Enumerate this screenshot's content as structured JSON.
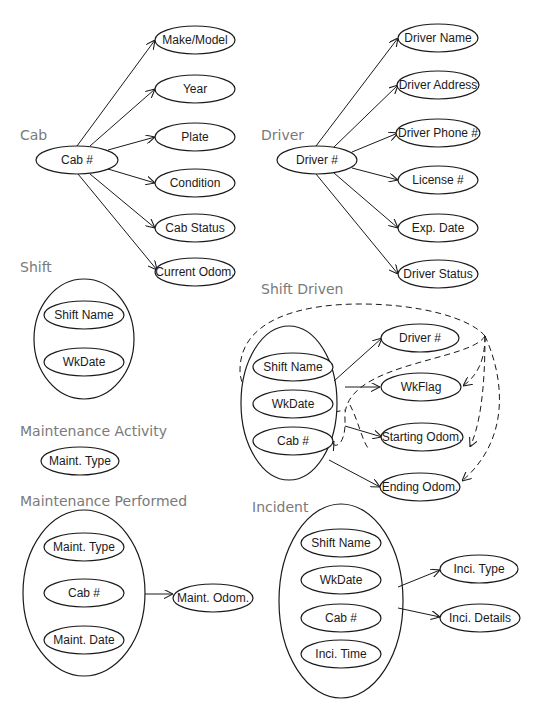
{
  "sections": {
    "cab": {
      "title": "Cab",
      "key": "Cab #",
      "attributes": [
        "Make/Model",
        "Year",
        "Plate",
        "Condition",
        "Cab Status",
        "Current Odom."
      ]
    },
    "driver": {
      "title": "Driver",
      "key": "Driver #",
      "attributes": [
        "Driver Name",
        "Driver Address",
        "Driver Phone #",
        "License #",
        "Exp. Date",
        "Driver Status"
      ]
    },
    "shift": {
      "title": "Shift",
      "composite_key": [
        "Shift Name",
        "WkDate"
      ]
    },
    "shift_driven": {
      "title": "Shift Driven",
      "composite_key": [
        "Shift Name",
        "WkDate",
        "Cab #"
      ],
      "attributes": [
        "Driver #",
        "WkFlag",
        "Starting Odom.",
        "Ending Odom."
      ]
    },
    "maintenance_activity": {
      "title": "Maintenance Activity",
      "key": "Maint. Type"
    },
    "maintenance_performed": {
      "title": "Maintenance Performed",
      "composite_key": [
        "Maint. Type",
        "Cab #",
        "Maint. Date"
      ],
      "attributes": [
        "Maint. Odom."
      ]
    },
    "incident": {
      "title": "Incident",
      "composite_key": [
        "Shift Name",
        "WkDate",
        "Cab #",
        "Inci. Time"
      ],
      "attributes": [
        "Inci. Type",
        "Inci. Details"
      ]
    }
  },
  "colors": {
    "stroke": "#1a1a1a",
    "title": "#7a7a7a",
    "background": "#ffffff"
  }
}
